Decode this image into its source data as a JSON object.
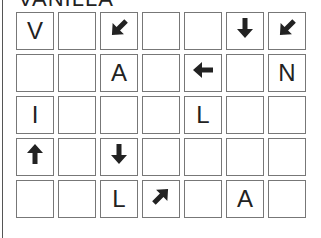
{
  "title": "VANILLA",
  "grid": {
    "cols": 7,
    "rows": 5,
    "cells": [
      [
        "V",
        "",
        "arrow-down-left",
        "",
        "",
        "arrow-down",
        "arrow-down-left"
      ],
      [
        "",
        "",
        "A",
        "",
        "arrow-left",
        "",
        "N"
      ],
      [
        "I",
        "",
        "",
        "",
        "L",
        "",
        ""
      ],
      [
        "arrow-up",
        "",
        "arrow-down",
        "",
        "",
        "",
        ""
      ],
      [
        "",
        "",
        "L",
        "arrow-up-right",
        "",
        "A",
        ""
      ]
    ]
  }
}
